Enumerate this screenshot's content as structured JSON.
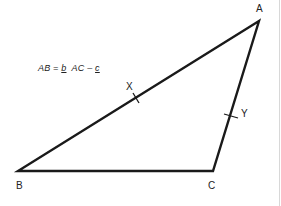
{
  "diagram": {
    "type": "triangle",
    "vertices": {
      "A": {
        "label": "A",
        "x": 259,
        "y": 21
      },
      "B": {
        "label": "B",
        "x": 18,
        "y": 171
      },
      "C": {
        "label": "C",
        "x": 213,
        "y": 171
      }
    },
    "midpoints": {
      "X": {
        "label": "X",
        "on": "AB"
      },
      "Y": {
        "label": "Y",
        "on": "AC"
      }
    },
    "formula": {
      "part1": "AB = ",
      "b": "b",
      "part2": "  AC – ",
      "c": "c"
    },
    "colors": {
      "line": "#1a1a1a",
      "background": "#ffffff"
    }
  }
}
